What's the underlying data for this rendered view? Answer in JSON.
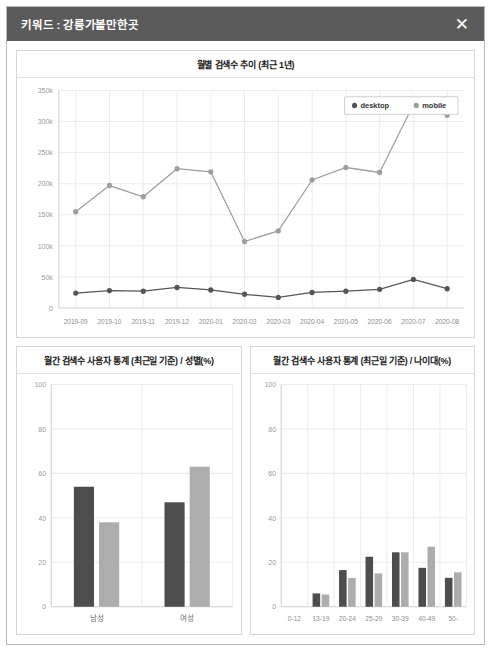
{
  "header": {
    "title": "키워드 : 강릉가볼만한곳",
    "close_label": "✕"
  },
  "colors": {
    "header_bg": "#5b5b5b",
    "desktop": "#555555",
    "mobile": "#9e9e9e",
    "panel_border": "#d5d5d5",
    "grid": "#ececec"
  },
  "panels": {
    "trend": {
      "title": "월별 검색수 추이 (최근 1년)"
    },
    "gender": {
      "title": "월간 검색수 사용자 통계 (최근일 기준) / 성별(%)"
    },
    "age": {
      "title": "월간 검색수 사용자 통계 (최근일 기준) / 나이대(%)"
    }
  },
  "chart_data": [
    {
      "id": "trend",
      "type": "line",
      "title": "월별 검색수 추이 (최근 1년)",
      "xlabel": "",
      "ylabel": "",
      "ylim": [
        0,
        350000
      ],
      "yticks": [
        0,
        50000,
        100000,
        150000,
        200000,
        250000,
        300000,
        350000
      ],
      "ytick_labels": [
        "0",
        "50k",
        "100k",
        "150k",
        "200k",
        "250k",
        "300k",
        "350k"
      ],
      "grid": true,
      "legend_position": "top-right",
      "categories": [
        "2019-09",
        "2019-10",
        "2019-11",
        "2019-12",
        "2020-01",
        "2020-02",
        "2020-03",
        "2020-04",
        "2020-05",
        "2020-06",
        "2020-07",
        "2020-08"
      ],
      "series": [
        {
          "name": "desktop",
          "color": "#555555",
          "values": [
            24000,
            28000,
            27000,
            33000,
            29000,
            22000,
            17000,
            25000,
            27000,
            30000,
            46000,
            31000
          ]
        },
        {
          "name": "mobile",
          "color": "#9e9e9e",
          "values": [
            155000,
            197000,
            179000,
            224000,
            219000,
            107000,
            124000,
            206000,
            226000,
            218000,
            327000,
            310000
          ]
        }
      ]
    },
    {
      "id": "gender",
      "type": "bar",
      "title": "월간 검색수 사용자 통계 (최근일 기준) / 성별(%)",
      "xlabel": "",
      "ylabel": "",
      "ylim": [
        0,
        100
      ],
      "yticks": [
        0,
        20,
        40,
        60,
        80,
        100
      ],
      "ytick_labels": [
        "0",
        "20",
        "40",
        "60",
        "80",
        "100"
      ],
      "grid": true,
      "categories": [
        "남성",
        "여성"
      ],
      "series": [
        {
          "name": "desktop",
          "color": "#4d4d4d",
          "values": [
            54,
            47
          ]
        },
        {
          "name": "mobile",
          "color": "#adadad",
          "values": [
            38,
            63
          ]
        }
      ]
    },
    {
      "id": "age",
      "type": "bar",
      "title": "월간 검색수 사용자 통계 (최근일 기준) / 나이대(%)",
      "xlabel": "",
      "ylabel": "",
      "ylim": [
        0,
        100
      ],
      "yticks": [
        0,
        20,
        40,
        60,
        80,
        100
      ],
      "ytick_labels": [
        "0",
        "20",
        "40",
        "60",
        "80",
        "100"
      ],
      "grid": true,
      "categories": [
        "0-12",
        "13-19",
        "20-24",
        "25-29",
        "30-39",
        "40-49",
        "50-"
      ],
      "series": [
        {
          "name": "desktop",
          "color": "#4d4d4d",
          "values": [
            0,
            6,
            16.5,
            22.5,
            24.5,
            17.5,
            13
          ]
        },
        {
          "name": "mobile",
          "color": "#adadad",
          "values": [
            0,
            5.5,
            13,
            15,
            24.5,
            27,
            15.5
          ]
        }
      ]
    }
  ]
}
